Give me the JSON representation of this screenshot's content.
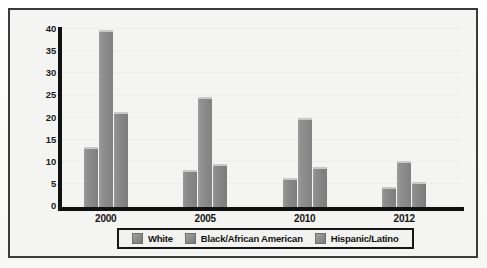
{
  "chart_data": {
    "type": "bar",
    "title": "",
    "subtitle": "",
    "xlabel": "",
    "ylabel": "",
    "categories": [
      "2000",
      "2005",
      "2010",
      "2012"
    ],
    "series": [
      {
        "name": "White",
        "values": [
          13,
          8,
          6,
          4
        ],
        "color": "#8d8d8d"
      },
      {
        "name": "Black/African American",
        "values": [
          39.5,
          24.3,
          19.7,
          10
        ],
        "color": "#909090"
      },
      {
        "name": "Hispanic/Latino",
        "values": [
          21,
          9.2,
          8.5,
          5.3
        ],
        "color": "#8b8b8b"
      }
    ],
    "ylim": [
      0,
      40
    ],
    "yticks": [
      0,
      5,
      10,
      15,
      20,
      25,
      30,
      35,
      40
    ],
    "ytick_labels": [
      "0",
      "5",
      "10",
      "15",
      "20",
      "25",
      "30",
      "35",
      "40"
    ],
    "grid": true,
    "legend_position": "bottom"
  },
  "frame": {
    "border_color": "#3a3a3a",
    "background": "#f4f4f2"
  },
  "axis": {
    "line_color": "#111111"
  }
}
